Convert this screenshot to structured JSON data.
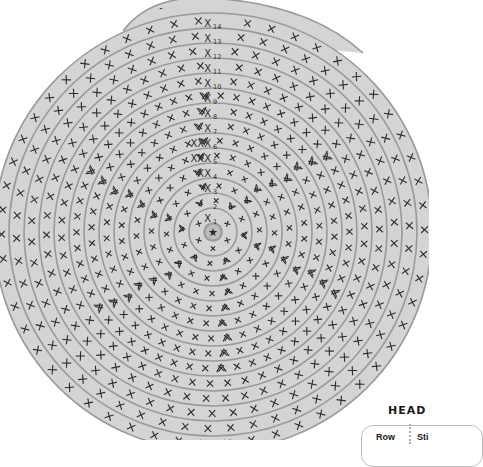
{
  "chart": {
    "center": {
      "x": 213,
      "y": 232
    },
    "ring_colors": {
      "fill": "#d4d4d4",
      "stroke": "#9a9a9a",
      "stitch": "#2b2b2b",
      "label": "#2b2b2b",
      "background": "#ffffff"
    },
    "start_symbol": "★",
    "tail_marker": "-",
    "ring_spacing": 15,
    "inner_radius": 9,
    "rows": [
      {
        "row": 1,
        "label": "X",
        "subscript": "1",
        "stitches": 6
      },
      {
        "row": 2,
        "label": "",
        "subscript": "2",
        "stitches": 12
      },
      {
        "row": 3,
        "label": "X",
        "subscript": "3",
        "stitches": 18
      },
      {
        "row": 4,
        "label": "XX",
        "subscript": "4",
        "stitches": 24
      },
      {
        "row": 5,
        "label": "XXX",
        "subscript": "5",
        "stitches": 30
      },
      {
        "row": 6,
        "label": "XXX",
        "subscript": "6",
        "stitches": 36
      },
      {
        "row": 7,
        "label": "X",
        "subscript": "7",
        "stitches": 42
      },
      {
        "row": 8,
        "label": "X",
        "subscript": "8",
        "stitches": 48
      },
      {
        "row": 9,
        "label": "X",
        "subscript": "9",
        "stitches": 54
      },
      {
        "row": 10,
        "label": "X",
        "subscript": "10",
        "stitches": 54
      },
      {
        "row": 11,
        "label": "X",
        "subscript": "11",
        "stitches": 54
      },
      {
        "row": 12,
        "label": "X",
        "subscript": "12",
        "stitches": 54
      },
      {
        "row": 13,
        "label": "X",
        "subscript": "13",
        "stitches": 54
      },
      {
        "row": 14,
        "label": "X",
        "subscript": "14",
        "stitches": 54
      }
    ],
    "legend": {
      "single_crochet": "X",
      "increase": "V (two stitches in one)",
      "magic_ring": "★"
    }
  },
  "section": {
    "heading": "HEAD",
    "table_headers": [
      "Row",
      "Sti"
    ]
  }
}
